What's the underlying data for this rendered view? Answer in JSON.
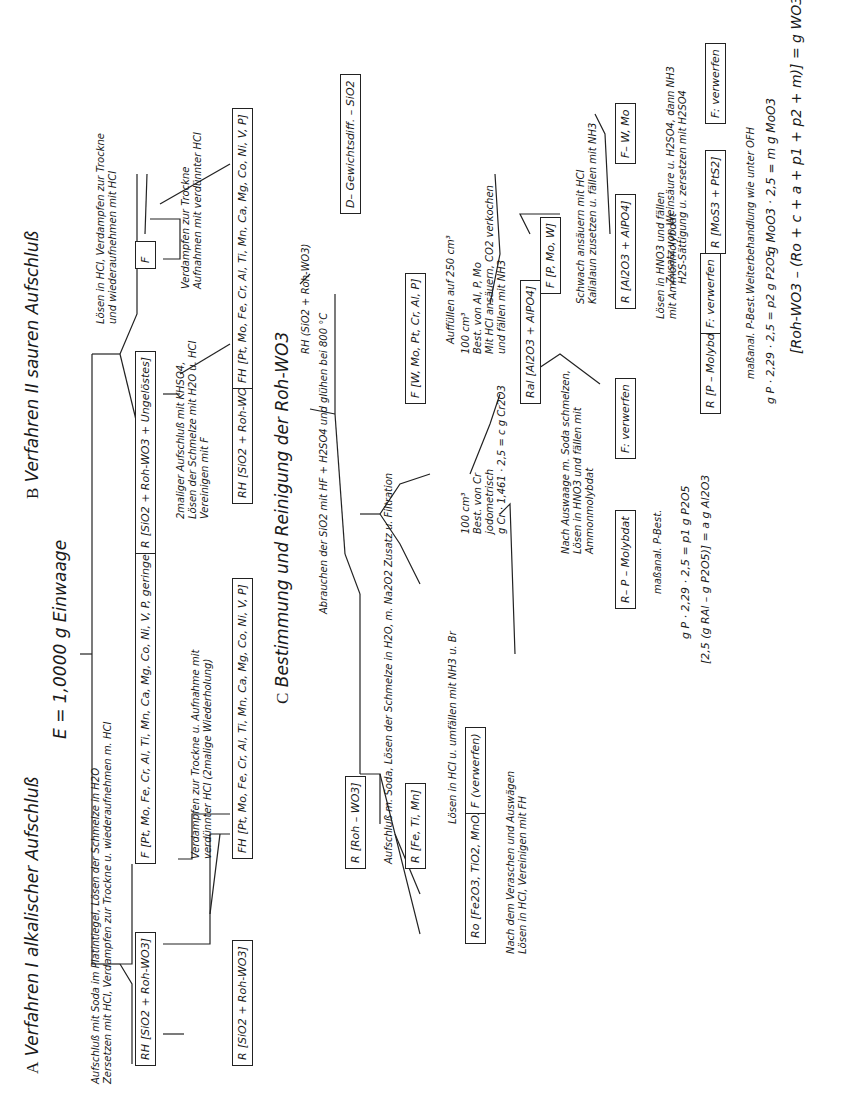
{
  "title": "E = 1,0000 g Einwaage",
  "sections": {
    "A": {
      "letter": "A",
      "title": "Verfahren I alkalischer Aufschluß"
    },
    "B": {
      "letter": "B",
      "title": "Verfahren II sauren Aufschluß"
    },
    "C": {
      "letter": "C",
      "title": "Bestimmung und Reinigung der Roh-WO3"
    }
  },
  "A": {
    "step1": "Aufschluß mit Soda im Platintiegel, Lösen der Schmelze in H2O\nZersetzen mit HCl, Verdampfen zur Trockne u. wiederaufnehmen m. HCl",
    "box_RH": {
      "label": "RH",
      "content": "[SiO2 + Roh-WO3]"
    },
    "box_F": {
      "label": "F",
      "content": "[Pt, Mo, Fe, Cr, Al, Ti, Mn, Ca, Mg, Co, Ni, V, P,\ngeringe Mengen SiO2 u. WO3]"
    },
    "step2": "Verdampfen zur Trockne u. Aufnahme mit\nverdünnter HCl (2malige Wiederholung)",
    "box_R": {
      "label": "R",
      "content": "[SiO2 + Roh-WO3]"
    },
    "box_FH": {
      "label": "FH",
      "content": "[Pt, Mo, Fe, Cr, Al, Ti, Mn, Ca, Mg, Co, Ni, V, P]"
    }
  },
  "B": {
    "step1": "Lösen in HCl, Verdampfen zur Trockne\nund wiederaufnehmen mit HCl",
    "box_R": {
      "label": "R",
      "content": "[SiO2 + Roh-WO3 + Ungelöstes]"
    },
    "step2": "2maliger Aufschluß mit KHSO4,\nLösen der Schmelze mit H2O u. HCl\nVereinigen mit F",
    "box_F": {
      "label": "F",
      "content": ""
    },
    "box_RH": {
      "label": "RH",
      "content": "[SiO2 + Roh-WO3]"
    },
    "step3": "Verdampfen zur Trockne\nAufnahmen mit verdünnter HCl",
    "box_FH": {
      "label": "FH",
      "content": "[Pt, Mo, Fe, Cr, Al, Ti, Mn, Ca, Mg, Co, Ni, V, P]"
    }
  },
  "C": {
    "rh_note": "RH (SiO2 + Roh-WO3)",
    "step1": "Abrauchen der SiO2 mit HF + H2SO4 und glühen bei 800 °C",
    "box_D": {
      "label": "D",
      "content": "– Gewichtsdiff. – SiO2"
    },
    "box_R_roh": {
      "label": "R",
      "content": "[Roh – WO3]"
    },
    "step2": "Aufschluß m. Soda, Lösen der Schmelze in H2O, m. Na2O2 Zusatz u. Filtration",
    "box_R_fe": {
      "label": "R",
      "content": "[Fe, Ti, Mn]"
    },
    "box_F_w": {
      "label": "F",
      "content": "[W, Mo, Pt, Cr, Al, P]"
    },
    "step3": "Lösen in HCl u. umfällen mit NH3 u. Br",
    "box_Ro": {
      "label": "Ro",
      "content": "[Fe2O3, TiO2, MnO2]"
    },
    "box_F_verwerfen": {
      "label": "F",
      "content": "(verwerfen)"
    },
    "step4": "Nach dem Veraschen und Auswägen\nLösen in HCl, Vereinigen mit FH",
    "auffuellen": "Auffüllen auf 250 cm³",
    "aliquot1": "100 cm³\nBest. von Cr\njodometrisch\ng Cr · 1,461 · 2,5 = c g Cr2O3",
    "aliquot2": "100 cm³\nBest. von Al, P, Mo\nMit HCl ansäuern, CO2 verkochen\nund fällen mit NH3",
    "box_Ral": {
      "label": "Ral",
      "content": "[Al2O3 + AlPO4]"
    },
    "box_F_pmow": {
      "label": "F",
      "content": "[P, Mo, W]"
    },
    "step5": "Nach Auswaage m. Soda schmelzen,\nLösen in HNO3 und fällen mit\nAmmonmolybdat",
    "box_R_pmolyb1": {
      "label": "R",
      "content": "– P – Molybdat"
    },
    "box_F_verwerfen2": {
      "label": "F",
      "content": ": verwerfen"
    },
    "calc1": "maßanal. P-Best.",
    "calc2": "g P · 2,29 · 2,5 = p1 g P2O5",
    "calc3": "[2,5 (g RAl – g P2O5)] = a g Al2O3",
    "step6": "Schwach ansäuern mit HCl\nKaliaIaun zusetzen u. fällen mit NH3",
    "box_R_alpo": {
      "label": "R",
      "content": "[Al2O3 + AlPO4]"
    },
    "box_F_wmo": {
      "label": "F",
      "content": "– W, Mo"
    },
    "step7": "Lösen in HNO3 und fällen\nmit Ammonmolybdat",
    "box_R_pmolyb2": {
      "label": "R",
      "content": "[P – Molybdat]"
    },
    "box_F_verwerfen3": {
      "label": "F",
      "content": ": verwerfen"
    },
    "calc4": "maßanal. P-Best.",
    "calc5": "g P · 2,29 · 2,5 = p2 g P2O5",
    "step8": "Zusatz von Weinsäure u. H2SO4, dann NH3\nH2S-Sättigung u. zersetzen mit H2SO4",
    "box_R_mos": {
      "label": "R",
      "content": "[MoS3 + PtS2]"
    },
    "box_F_verwerfen4": {
      "label": "F",
      "content": ": verwerfen"
    },
    "step9": "Weiterbehandlung wie unter OFH",
    "calc6": "g MoO3 · 2,5 = m g MoO3",
    "final": "[Roh-WO3 – (Ro + c + a + p1 + p2 + m)] = g WO3"
  }
}
